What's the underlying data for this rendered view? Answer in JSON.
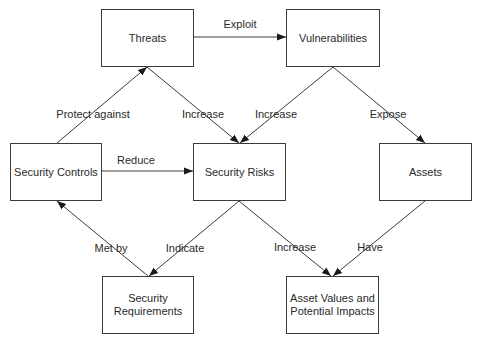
{
  "diagram": {
    "nodes": [
      {
        "id": "threats",
        "label": "Threats",
        "x": 101,
        "y": 9,
        "w": 93,
        "h": 58
      },
      {
        "id": "vulnerabilities",
        "label": "Vulnerabilities",
        "x": 286,
        "y": 9,
        "w": 94,
        "h": 58
      },
      {
        "id": "security-controls",
        "label": "Security Controls",
        "x": 10,
        "y": 143,
        "w": 92,
        "h": 58
      },
      {
        "id": "security-risks",
        "label": "Security Risks",
        "x": 193,
        "y": 143,
        "w": 93,
        "h": 58
      },
      {
        "id": "assets",
        "label": "Assets",
        "x": 379,
        "y": 143,
        "w": 93,
        "h": 58
      },
      {
        "id": "security-requirements",
        "label": "Security\nRequirements",
        "x": 102,
        "y": 276,
        "w": 92,
        "h": 58
      },
      {
        "id": "asset-values",
        "label": "Asset Values and\nPotential Impacts",
        "x": 286,
        "y": 276,
        "w": 93,
        "h": 58
      }
    ],
    "edges": [
      {
        "from": "threats",
        "to": "vulnerabilities",
        "label": "Exploit"
      },
      {
        "from": "security-controls",
        "to": "threats",
        "label": "Protect against"
      },
      {
        "from": "threats",
        "to": "security-risks",
        "label": "Increase"
      },
      {
        "from": "vulnerabilities",
        "to": "security-risks",
        "label": "Increase"
      },
      {
        "from": "vulnerabilities",
        "to": "assets",
        "label": "Expose"
      },
      {
        "from": "security-controls",
        "to": "security-risks",
        "label": "Reduce"
      },
      {
        "from": "security-requirements",
        "to": "security-controls",
        "label": "Met by"
      },
      {
        "from": "security-risks",
        "to": "security-requirements",
        "label": "Indicate"
      },
      {
        "from": "security-risks",
        "to": "asset-values",
        "label": "Increase"
      },
      {
        "from": "assets",
        "to": "asset-values",
        "label": "Have"
      }
    ]
  },
  "labels": {
    "threats": "Threats",
    "vulnerabilities": "Vulnerabilities",
    "security_controls": "Security Controls",
    "security_risks": "Security Risks",
    "assets": "Assets",
    "security_requirements_1": "Security",
    "security_requirements_2": "Requirements",
    "asset_values_1": "Asset Values and",
    "asset_values_2": "Potential Impacts",
    "edge_exploit": "Exploit",
    "edge_protect_against": "Protect against",
    "edge_increase_threats": "Increase",
    "edge_increase_vuln": "Increase",
    "edge_expose": "Expose",
    "edge_reduce": "Reduce",
    "edge_met_by": "Met by",
    "edge_indicate": "Indicate",
    "edge_increase_impacts": "Increase",
    "edge_have": "Have"
  },
  "colors": {
    "stroke": "#3a3a3a",
    "text": "#2a2a2a",
    "background": "#ffffff"
  }
}
